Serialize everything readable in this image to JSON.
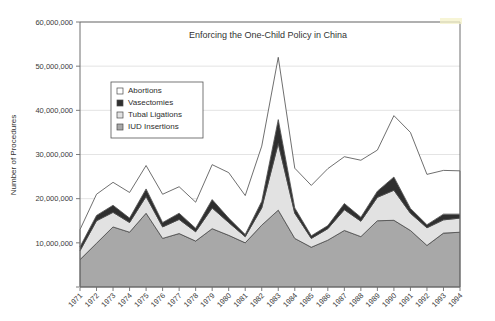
{
  "chart_data": {
    "type": "area",
    "title": "Enforcing the One-Child Policy in China",
    "xlabel": "",
    "ylabel": "Number of Procedures",
    "stacked": true,
    "grid": true,
    "legend_position": "inside-upper-left",
    "ylim": [
      0,
      60000000
    ],
    "ytick_labels": [
      "60,000,000",
      "50,000,000",
      "40,000,000",
      "30,000,000",
      "20,000,000",
      "10,000,000"
    ],
    "ytick_values": [
      60000000,
      50000000,
      40000000,
      30000000,
      20000000,
      10000000
    ],
    "categories": [
      "1971",
      "1972",
      "1973",
      "1974",
      "1975",
      "1976",
      "1977",
      "1978",
      "1979",
      "1980",
      "1981",
      "1982",
      "1983",
      "1984",
      "1985",
      "1986",
      "1987",
      "1988",
      "1989",
      "1990",
      "1991",
      "1992",
      "1993",
      "1994"
    ],
    "series": [
      {
        "name": "IUD Insertions",
        "color": "#a8a8a8",
        "values": [
          6200000,
          9900000,
          13600000,
          12400000,
          16700000,
          11000000,
          12100000,
          10400000,
          13200000,
          11700000,
          10000000,
          14000000,
          17400000,
          11000000,
          9000000,
          10600000,
          12800000,
          11400000,
          15000000,
          15100000,
          12800000,
          9400000,
          12200000,
          12400000
        ]
      },
      {
        "name": "Tubal Ligations",
        "color": "#e2e2e2",
        "values": [
          2000000,
          5100000,
          3300000,
          2200000,
          3800000,
          2600000,
          3200000,
          2100000,
          4700000,
          2900000,
          1400000,
          3900000,
          15100000,
          5700000,
          2000000,
          2600000,
          4700000,
          3500000,
          5300000,
          6800000,
          3900000,
          4000000,
          3000000,
          3200000
        ]
      },
      {
        "name": "Vasectomies",
        "color": "#2f2f2f",
        "values": [
          900000,
          1200000,
          1600000,
          1000000,
          1700000,
          1000000,
          1400000,
          800000,
          1900000,
          1000000,
          500000,
          1500000,
          5400000,
          1200000,
          600000,
          700000,
          1400000,
          900000,
          1400000,
          3000000,
          1100000,
          700000,
          1300000,
          900000
        ]
      },
      {
        "name": "Abortions",
        "color": "#ffffff",
        "values": [
          3900000,
          4800000,
          5200000,
          5800000,
          5300000,
          6400000,
          6000000,
          5900000,
          7900000,
          10300000,
          8800000,
          12500000,
          14100000,
          9000000,
          11400000,
          12900000,
          10600000,
          12900000,
          9300000,
          13900000,
          17200000,
          11400000,
          9900000,
          9800000
        ]
      }
    ],
    "totals": [
      13000000,
      21000000,
      23700000,
      21400000,
      27500000,
      21000000,
      22700000,
      19200000,
      27700000,
      25900000,
      20700000,
      31900000,
      52000000,
      26900000,
      23000000,
      26800000,
      29500000,
      28700000,
      31000000,
      38800000,
      35000000,
      25500000,
      26400000,
      26300000
    ]
  },
  "legend": {
    "items": [
      {
        "label": "Abortions",
        "swatch": "white-swatch"
      },
      {
        "label": "Vasectomies",
        "swatch": "black-swatch"
      },
      {
        "label": "Tubal Ligations",
        "swatch": "light-gray-swatch"
      },
      {
        "label": "IUD Insertions",
        "swatch": "medium-gray-swatch"
      }
    ]
  },
  "colors": {
    "iud_insertions": "#a8a8a8",
    "tubal_ligations": "#e2e2e2",
    "vasectomies": "#2f2f2f",
    "abortions": "#ffffff",
    "grid": "#d9d9d9",
    "frame": "#6e6e6e",
    "text": "#333333"
  }
}
